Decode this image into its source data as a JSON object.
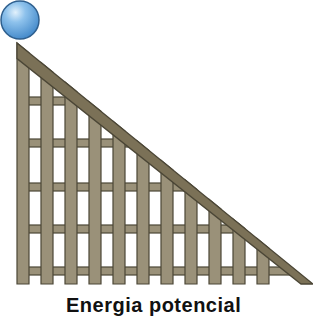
{
  "figure": {
    "caption": "Energia potencial",
    "ball": {
      "cx": 20,
      "cy": 20,
      "r": 19,
      "color": "#5a9ed8",
      "highlight": "#d8ecfb",
      "outline": "#2e5f8e"
    },
    "structure": {
      "fill": "#9a9179",
      "outline": "#4b4636",
      "posts": [
        17,
        41,
        65,
        89,
        113,
        137,
        161,
        185,
        209,
        233,
        257
      ],
      "post_width": 12,
      "post_bottom": 284,
      "rails_y": [
        97,
        139,
        183,
        225,
        267
      ],
      "rail_height": 8,
      "diagonal": {
        "x1": 17,
        "y1": 43,
        "x2": 313,
        "y2": 284,
        "thickness": 12
      }
    }
  }
}
